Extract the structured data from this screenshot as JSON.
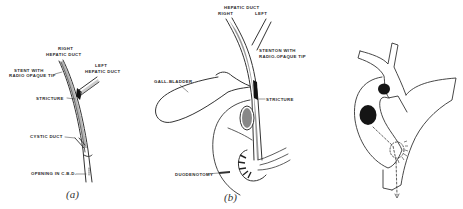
{
  "figure_a": {
    "caption": "(a)",
    "labels": {
      "right_hepatic_duct_1": "RIGHT",
      "right_hepatic_duct_2": "HEPATIC DUCT",
      "stent_1": "STENT WITH",
      "stent_2": "RADIO OPAQUE TIP",
      "left_hepatic_duct_1": "LEFT",
      "left_hepatic_duct_2": "HEPATIC DUCT",
      "stricture": "STRICTURE",
      "cystic_duct": "CYSTIC DUCT",
      "opening": "OPENING IN C.B.D."
    }
  },
  "figure_b": {
    "caption": "(b)",
    "labels": {
      "hepatic_duct": "HEPATIC DUCT",
      "right": "RIGHT",
      "left": "LEFT",
      "stenton_1": "STENTON WITH",
      "stenton_2": "RADIO-OPAQUE TIP",
      "gall_bladder": "GALL-BLADDER",
      "stricture": "STRICTURE",
      "duodenotomy": "DUODENOTOMY"
    }
  },
  "figure_c": {
    "caption": ""
  },
  "colors": {
    "ink": "#2a2a2a",
    "background": "#ffffff"
  }
}
